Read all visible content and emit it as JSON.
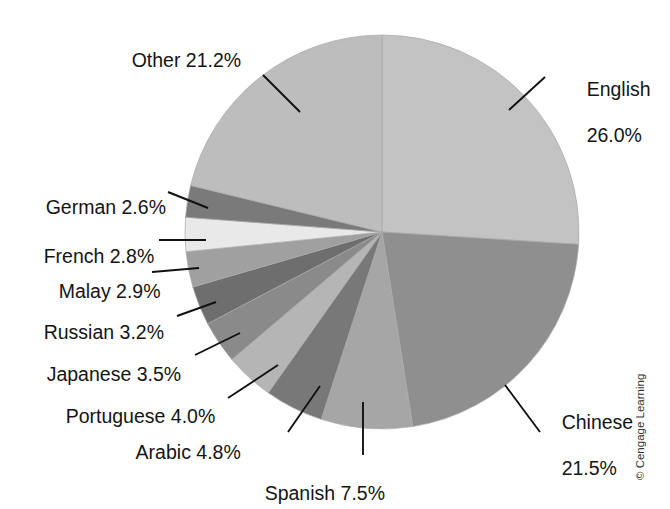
{
  "chart_data": {
    "type": "pie",
    "title": "",
    "subtitle": "",
    "xlabel": "",
    "ylabel": "",
    "legend_position": "none",
    "grid": false,
    "start_angle_deg": 0,
    "direction": "clockwise",
    "units": "percent",
    "total": 100.0,
    "categories": [
      "English",
      "Chinese",
      "Spanish",
      "Arabic",
      "Portuguese",
      "Japanese",
      "Russian",
      "Malay",
      "French",
      "German",
      "Other"
    ],
    "values": [
      26.0,
      21.5,
      7.5,
      4.8,
      4.0,
      3.5,
      3.2,
      2.9,
      2.8,
      2.6,
      21.2
    ],
    "slices": [
      {
        "name": "English",
        "value": 26.0,
        "label": "English\n26.0%",
        "color": "#c3c3c3"
      },
      {
        "name": "Chinese",
        "value": 21.5,
        "label": "Chinese\n21.5%",
        "color": "#8f8f8f"
      },
      {
        "name": "Spanish",
        "value": 7.5,
        "label": "Spanish 7.5%",
        "color": "#a6a6a6"
      },
      {
        "name": "Arabic",
        "value": 4.8,
        "label": "Arabic 4.8%",
        "color": "#787878"
      },
      {
        "name": "Portuguese",
        "value": 4.0,
        "label": "Portuguese 4.0%",
        "color": "#b5b5b5"
      },
      {
        "name": "Japanese",
        "value": 3.5,
        "label": "Japanese 3.5%",
        "color": "#8a8a8a"
      },
      {
        "name": "Russian",
        "value": 3.2,
        "label": "Russian 3.2%",
        "color": "#6e6e6e"
      },
      {
        "name": "Malay",
        "value": 2.9,
        "label": "Malay 2.9%",
        "color": "#a0a0a0"
      },
      {
        "name": "French",
        "value": 2.8,
        "label": "French 2.8%",
        "color": "#e9e9e9"
      },
      {
        "name": "German",
        "value": 2.6,
        "label": "German 2.6%",
        "color": "#7a7a7a"
      },
      {
        "name": "Other",
        "value": 21.2,
        "label": "Other 21.2%",
        "color": "#bdbdbd"
      }
    ]
  },
  "labels": {
    "other": {
      "line1": "Other 21.2%",
      "line2": ""
    },
    "english": {
      "line1": "English",
      "line2": "26.0%"
    },
    "german": {
      "line1": "German 2.6%",
      "line2": ""
    },
    "french": {
      "line1": "French 2.8%",
      "line2": ""
    },
    "malay": {
      "line1": "Malay 2.9%",
      "line2": ""
    },
    "russian": {
      "line1": "Russian 3.2%",
      "line2": ""
    },
    "japanese": {
      "line1": "Japanese 3.5%",
      "line2": ""
    },
    "portuguese": {
      "line1": "Portuguese 4.0%",
      "line2": ""
    },
    "arabic": {
      "line1": "Arabic 4.8%",
      "line2": ""
    },
    "spanish": {
      "line1": "Spanish 7.5%",
      "line2": ""
    },
    "chinese": {
      "line1": "Chinese",
      "line2": "21.5%"
    }
  },
  "footer": {
    "copyright": "© Cengage Learning"
  },
  "colors": {
    "background": "#ffffff",
    "text": "#141414",
    "leader_line": "#111111",
    "copyright_text": "#333333"
  }
}
